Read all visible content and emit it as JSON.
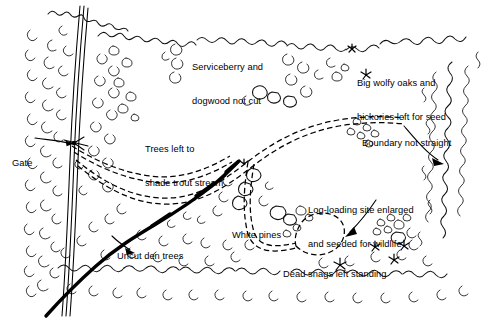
{
  "map": {
    "title": "Timber harvest plan sketch map",
    "style": "pen-and-ink line drawing",
    "background_color": "#ffffff",
    "ink_color": "#000000",
    "labels": [
      {
        "id": "serviceberry",
        "text": "Serviceberry and\ndogwood not cut",
        "x": 192,
        "y": 40,
        "lines": [
          "Serviceberry and",
          "dogwood not cut"
        ]
      },
      {
        "id": "big-wolfy-oaks",
        "text": "Big wolfy oaks and\nhickories left for seed",
        "x": 357,
        "y": 56,
        "lines": [
          "Big wolfy oaks and",
          "hickories left for seed"
        ]
      },
      {
        "id": "trees-trout-stream",
        "text": "Trees left to\nshade trout stream",
        "x": 145,
        "y": 122,
        "lines": [
          "Trees left to",
          "shade trout stream"
        ]
      },
      {
        "id": "boundary-not-straight",
        "text": "Boundary not straight",
        "x": 362,
        "y": 116,
        "lines": [
          "Boundary not straight"
        ]
      },
      {
        "id": "log-loading-site",
        "text": "Log-loading site enlarged\nand seeded for wildlife",
        "x": 308,
        "y": 183,
        "lines": [
          "Log-loading site enlarged",
          "and seeded for wildlife"
        ]
      },
      {
        "id": "white-pines",
        "text": "White pines",
        "x": 232,
        "y": 208,
        "lines": [
          "White pines"
        ]
      },
      {
        "id": "uncut-den-trees",
        "text": "Uncut den trees",
        "x": 117,
        "y": 229,
        "lines": [
          "Uncut den trees"
        ]
      },
      {
        "id": "dead-snags",
        "text": "Dead snags left standing",
        "x": 283,
        "y": 247,
        "lines": [
          "Dead snags left standing"
        ]
      },
      {
        "id": "gate",
        "text": "Gate",
        "x": 12,
        "y": 136,
        "lines": [
          "Gate"
        ]
      }
    ],
    "features": [
      {
        "id": "access-road",
        "kind": "road",
        "description": "three-line access road running top to bottom along left side"
      },
      {
        "id": "gate-marker",
        "kind": "gate",
        "description": "gate symbol crossing the access road"
      },
      {
        "id": "skid-trail-network",
        "kind": "dashed-trail",
        "description": "dashed double-line skid trail network"
      },
      {
        "id": "log-loading-loop",
        "kind": "dashed-loop",
        "description": "enlarged dashed loop at log-loading site"
      },
      {
        "id": "trout-stream",
        "kind": "stream",
        "description": "heavy black line trout stream, lower left to upper right"
      },
      {
        "id": "vegetation-boundary",
        "kind": "boundary",
        "description": "scalloped crown vegetation edge forming irregular stand boundary"
      },
      {
        "id": "dead-snag-symbols",
        "kind": "snag-symbols",
        "description": "star-shaped dead snag symbols"
      }
    ]
  }
}
